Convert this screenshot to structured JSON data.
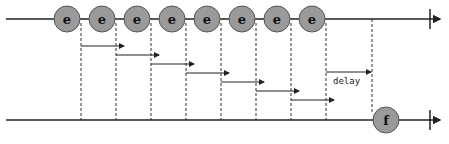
{
  "diagram": {
    "type": "marble-diagram",
    "operator_label": "delay",
    "colors": {
      "line": "#222222",
      "marble_fill": "#9a9a9a",
      "marble_stroke": "#555555",
      "dashed": "#333333"
    },
    "input_stream": {
      "y": 19,
      "events": [
        {
          "label": "e",
          "x": 67
        },
        {
          "label": "e",
          "x": 102
        },
        {
          "label": "e",
          "x": 137
        },
        {
          "label": "e",
          "x": 172
        },
        {
          "label": "e",
          "x": 207
        },
        {
          "label": "e",
          "x": 242
        },
        {
          "label": "e",
          "x": 277
        },
        {
          "label": "e",
          "x": 312
        }
      ],
      "completion_x": 430
    },
    "output_stream": {
      "y": 120,
      "events": [
        {
          "label": "f",
          "x": 386
        }
      ],
      "completion_x": 430
    }
  }
}
